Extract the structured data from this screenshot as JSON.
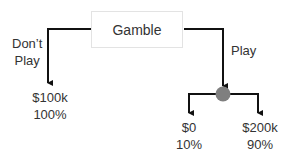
{
  "root": {
    "label": "Gamble"
  },
  "branches": {
    "left": {
      "label_line1": "Don’t",
      "label_line2": "Play"
    },
    "right": {
      "label": "Play"
    }
  },
  "outcomes": {
    "no_play": {
      "value": "$100k",
      "probability": "100%"
    },
    "lose": {
      "value": "$0",
      "probability": "10%"
    },
    "win": {
      "value": "$200k",
      "probability": "90%"
    }
  },
  "colors": {
    "line": "#111111",
    "chance_node": "#7f7f7f",
    "box_border": "#e3e3e3"
  }
}
